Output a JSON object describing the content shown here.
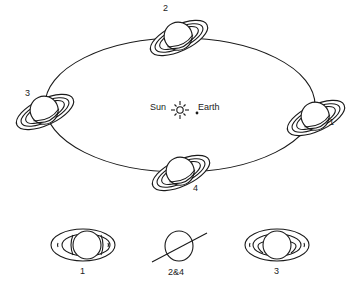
{
  "diagram": {
    "center": {
      "sun_label": "Sun",
      "earth_label": "Earth"
    },
    "orbit_positions": [
      {
        "label": "1",
        "position": "right"
      },
      {
        "label": "2",
        "position": "top"
      },
      {
        "label": "3",
        "position": "left"
      },
      {
        "label": "4",
        "position": "bottom"
      }
    ],
    "views": [
      {
        "label": "1",
        "appearance": "rings open, seen from below"
      },
      {
        "label": "2&4",
        "appearance": "rings edge-on"
      },
      {
        "label": "3",
        "appearance": "rings open, seen from above"
      }
    ],
    "colors": {
      "line": "#1a1a1a",
      "background": "#ffffff"
    }
  }
}
